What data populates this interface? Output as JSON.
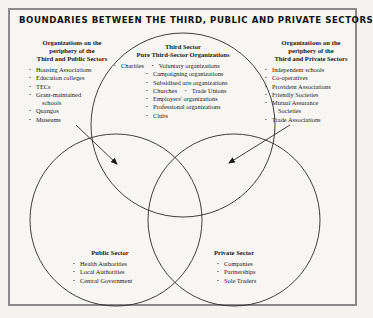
{
  "title": "BOUNDARIES BETWEEN THE THIRD, PUBLIC AND PRIVATE SECTORS",
  "colors": {
    "background": "#f7f6f3",
    "border": "#8a8a8a",
    "lines": "#2a2a2a",
    "text": "#1a1a1a"
  },
  "diagram": {
    "type": "venn-3",
    "circles": [
      "Third Sector",
      "Public Sector",
      "Private Sector"
    ],
    "arrows": [
      {
        "from": "Third and Public periphery",
        "to": "Third/Public overlap"
      },
      {
        "from": "Third and Private periphery",
        "to": "Third/Private overlap"
      }
    ]
  },
  "left_periphery": {
    "heading": [
      "Organizations on the",
      "periphery of the",
      "Third and Public Sectors"
    ],
    "items": [
      "Housing Associations",
      "Education colleges",
      "TECs",
      "Grant-maintained",
      "schools",
      "Quangos",
      "Museums"
    ]
  },
  "third_sector": {
    "heading": [
      "Third Sector",
      "Pure Third-Sector Organizations"
    ],
    "items": [
      "Charities",
      "Voluntary organizations",
      "Campaigning organizations",
      "Subsidised arts organizations",
      "Churches",
      "Trade Unions",
      "Employers' organizations",
      "Professional organizations",
      "Clubs"
    ]
  },
  "right_periphery": {
    "heading": [
      "Organizations on the",
      "periphery of the",
      "Third and Private Sectors"
    ],
    "items": [
      "Independent schools",
      "Co-operatives",
      "Provident Associations",
      "Friendly Societies",
      "Mutual Assurance",
      "Societies",
      "Trade Associations"
    ]
  },
  "public_sector": {
    "heading": "Public Sector",
    "items": [
      "Health Authorities",
      "Local Authorities",
      "Central Government"
    ]
  },
  "private_sector": {
    "heading": "Private Sector",
    "items": [
      "Companies",
      "Partnerships",
      "Sole Traders"
    ]
  }
}
